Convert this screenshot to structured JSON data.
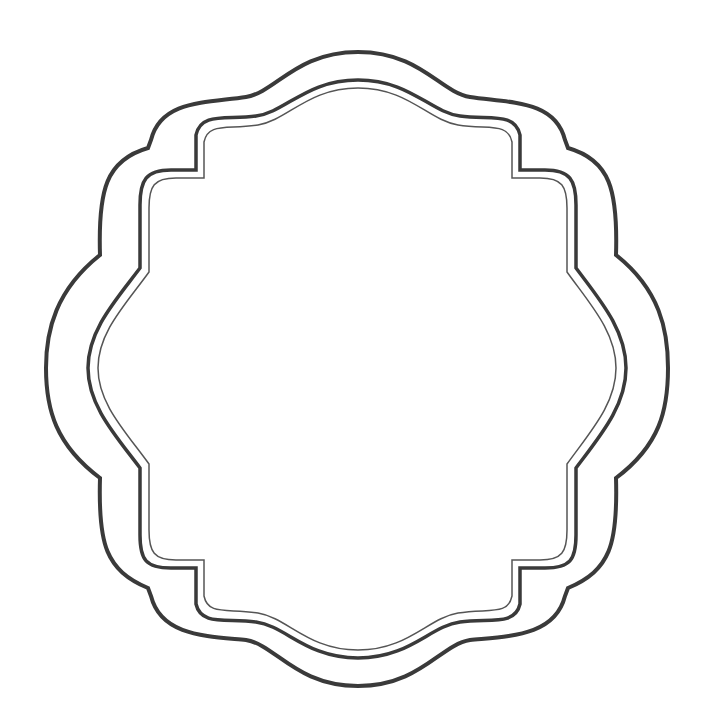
{
  "canvas": {
    "width": 710,
    "height": 726,
    "background": "#ffffff"
  },
  "frame": {
    "description": "decorative scalloped frame with three concentric outlines",
    "stroke_color": "#3a3a3a",
    "inner_stroke_color": "#555555"
  }
}
